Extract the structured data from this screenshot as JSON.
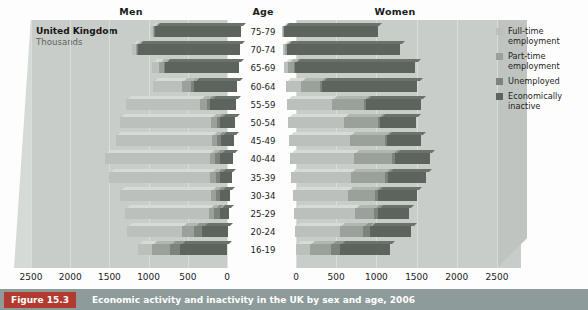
{
  "headers": {
    "men": "Men",
    "age": "Age",
    "women": "Women"
  },
  "source_label": {
    "country": "United Kingdom",
    "units": "Thousands"
  },
  "legend": {
    "items": [
      {
        "label": "Full-time employment",
        "color": "#bcc0bc",
        "key": "full_time"
      },
      {
        "label": "Part-time employment",
        "color": "#9aa09a",
        "key": "part_time"
      },
      {
        "label": "Unemployed",
        "color": "#7c837c",
        "key": "unemployed"
      },
      {
        "label": "Economically inactive",
        "color": "#5d645d",
        "key": "inactive"
      }
    ]
  },
  "caption": {
    "figure_number": "Figure 15.3",
    "text": "Economic activity and inactivity in the UK by sex and age, 2006"
  },
  "chart_data": {
    "type": "bar",
    "title": "Economic activity and inactivity in the UK by sex and age, 2006",
    "subtitle": "United Kingdom, Thousands",
    "xlabel": "Thousands",
    "ylabel": "Age",
    "orientation": "horizontal",
    "layout": "population-pyramid",
    "grid": true,
    "legend_position": "right",
    "stacked": true,
    "xlim_left": [
      2500,
      0
    ],
    "xlim_right": [
      0,
      2500
    ],
    "left_ticks": [
      2500,
      2000,
      1500,
      1000,
      500,
      0
    ],
    "right_ticks": [
      0,
      500,
      1000,
      1500,
      2000,
      2500
    ],
    "categories": [
      "75-79",
      "70-74",
      "65-69",
      "60-64",
      "55-59",
      "50-54",
      "45-49",
      "40-44",
      "35-39",
      "30-34",
      "25-29",
      "20-24",
      "16-19"
    ],
    "stack_order_men": [
      "inactive",
      "unemployed",
      "part_time",
      "full_time"
    ],
    "stack_order_women": [
      "full_time",
      "part_time",
      "unemployed",
      "inactive"
    ],
    "panels": [
      {
        "name": "Men",
        "direction": "left",
        "series": [
          {
            "name": "Full-time employment",
            "key": "full_time",
            "values": [
              25,
              40,
              90,
              370,
              940,
              1160,
              1230,
              1330,
              1300,
              1160,
              1070,
              700,
              180
            ]
          },
          {
            "name": "Part-time employment",
            "key": "part_time",
            "values": [
              15,
              20,
              60,
              120,
              90,
              75,
              65,
              70,
              65,
              60,
              65,
              150,
              230
            ]
          },
          {
            "name": "Unemployed",
            "key": "unemployed",
            "values": [
              5,
              10,
              15,
              30,
              45,
              45,
              50,
              60,
              60,
              60,
              70,
              110,
              130
            ]
          },
          {
            "name": "Economically inactive",
            "key": "inactive",
            "values": [
              1100,
              1300,
              940,
              560,
              330,
              190,
              165,
              165,
              145,
              130,
              120,
              330,
              600
            ]
          }
        ],
        "totals": [
          1145,
          1370,
          1105,
          1080,
          1405,
          1470,
          1510,
          1625,
          1570,
          1410,
          1325,
          1290,
          1140
        ]
      },
      {
        "name": "Women",
        "direction": "right",
        "series": [
          {
            "name": "Full-time employment",
            "key": "full_time",
            "values": [
              10,
              20,
              45,
              190,
              560,
              700,
              760,
              800,
              740,
              690,
              760,
              560,
              170
            ]
          },
          {
            "name": "Part-time employment",
            "key": "part_time",
            "values": [
              15,
              25,
              75,
              240,
              400,
              420,
              430,
              470,
              420,
              330,
              240,
              290,
              270
            ]
          },
          {
            "name": "Unemployed",
            "key": "unemployed",
            "values": [
              3,
              5,
              10,
              20,
              30,
              30,
              35,
              40,
              40,
              45,
              50,
              80,
              110
            ]
          },
          {
            "name": "Economically inactive",
            "key": "inactive",
            "values": [
              1160,
              1400,
              1500,
              1190,
              680,
              450,
              420,
              430,
              480,
              480,
              390,
              520,
              620
            ]
          }
        ],
        "totals": [
          1188,
          1450,
          1630,
          1640,
          1670,
          1600,
          1645,
          1740,
          1680,
          1545,
          1440,
          1450,
          1170
        ]
      }
    ]
  }
}
